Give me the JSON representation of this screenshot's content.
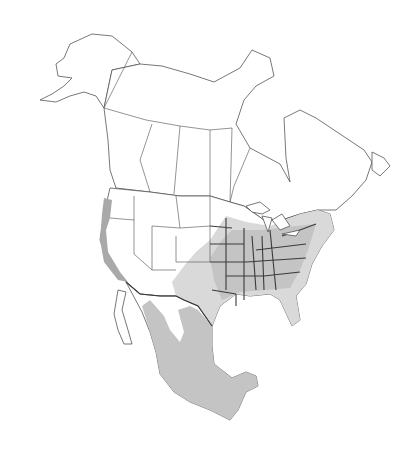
{
  "map": {
    "region": "North America",
    "type": "species range map",
    "colors": {
      "background": "#ffffff",
      "land": "#ffffff",
      "outline": "#555555",
      "range_light": "#d9d9d9",
      "range_mid": "#c4c4c4",
      "range_dark": "#a9a9a9"
    },
    "range_areas": [
      "Pacific coast (WA, OR, CA)",
      "Great Plains to Atlantic coast (eastern US)",
      "Mexico"
    ]
  }
}
